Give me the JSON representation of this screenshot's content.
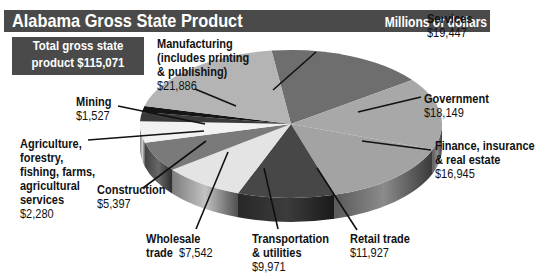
{
  "chart_data": {
    "type": "pie",
    "title": "Alabama Gross State Product",
    "subtitle": "Millions of dollars",
    "total_label": [
      "Total gross state",
      "product $115,071"
    ],
    "total": 115071,
    "slices": [
      {
        "name": "Services",
        "label": [
          "Services"
        ],
        "value_text": "$19,447",
        "value": 19447,
        "color": "#6e6e6e"
      },
      {
        "name": "Government",
        "label": [
          "Government"
        ],
        "value_text": "$18,149",
        "value": 18149,
        "color": "#a8a8a8"
      },
      {
        "name": "Finance, insurance & real estate",
        "label": [
          "Finance, insurance",
          "& real estate"
        ],
        "value_text": "$16,945",
        "value": 16945,
        "color": "#a3a3a3"
      },
      {
        "name": "Retail trade",
        "label": [
          "Retail trade"
        ],
        "value_text": "$11,927",
        "value": 11927,
        "color": "#474747"
      },
      {
        "name": "Transportation & utilities",
        "label": [
          "Transportation",
          "& utilities"
        ],
        "value_text": "$9,971",
        "value": 9971,
        "color": "#e4e4e4"
      },
      {
        "name": "Wholesale trade",
        "label": [
          "Wholesale",
          "trade"
        ],
        "value_text": "$7,542",
        "value": 7542,
        "color": "#7a7a7a"
      },
      {
        "name": "Construction",
        "label": [
          "Construction"
        ],
        "value_text": "$5,397",
        "value": 5397,
        "color": "#f2f2f2"
      },
      {
        "name": "Agriculture, forestry, fishing, farms, agricultural services",
        "label": [
          "Agriculture,",
          "forestry,",
          "fishing, farms,",
          "agricultural",
          "services"
        ],
        "value_text": "$2,280",
        "value": 2280,
        "color": "#3a3a3a"
      },
      {
        "name": "Mining",
        "label": [
          "Mining"
        ],
        "value_text": "$1,527",
        "value": 1527,
        "color": "#151515"
      },
      {
        "name": "Manufacturing (includes printing & publishing)",
        "label": [
          "Manufacturing",
          "(includes printing",
          "& publishing)"
        ],
        "value_text": "$21,886",
        "value": 21886,
        "color": "#b4b4b4"
      }
    ],
    "legend": "none (leader-line labels)"
  }
}
